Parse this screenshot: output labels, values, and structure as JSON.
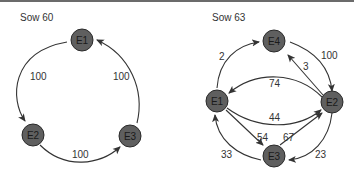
{
  "panels": [
    {
      "title": "Sow 60",
      "nodes": [
        "E1",
        "E2",
        "E3"
      ],
      "edges": [
        {
          "from": "E1",
          "to": "E2",
          "label": "100"
        },
        {
          "from": "E2",
          "to": "E3",
          "label": "100"
        },
        {
          "from": "E3",
          "to": "E1",
          "label": "100"
        }
      ]
    },
    {
      "title": "Sow 63",
      "nodes": [
        "E1",
        "E2",
        "E3",
        "E4"
      ],
      "edges": [
        {
          "from": "E1",
          "to": "E4",
          "label": "2"
        },
        {
          "from": "E4",
          "to": "E2",
          "label": "100"
        },
        {
          "from": "E2",
          "to": "E4",
          "label": "3"
        },
        {
          "from": "E2",
          "to": "E1",
          "label": "74"
        },
        {
          "from": "E1",
          "to": "E2",
          "label": "44"
        },
        {
          "from": "E1",
          "to": "E3",
          "label": "54"
        },
        {
          "from": "E3",
          "to": "E2",
          "label": "67"
        },
        {
          "from": "E3",
          "to": "E1",
          "label": "33"
        },
        {
          "from": "E2",
          "to": "E3",
          "label": "23"
        }
      ]
    }
  ]
}
